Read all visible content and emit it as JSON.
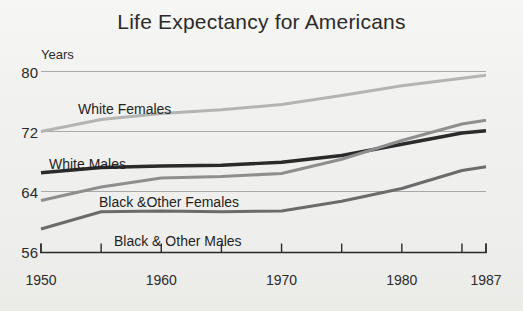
{
  "chart_data": {
    "type": "line",
    "title": "Life Expectancy for Americans",
    "xlabel": "",
    "ylabel": "Years",
    "ylim": [
      56,
      82
    ],
    "xlim": [
      1950,
      1987
    ],
    "grid": true,
    "gridlines_y": [
      64,
      72,
      80
    ],
    "legend_position": "inline-labels",
    "x": [
      1950,
      1955,
      1960,
      1965,
      1970,
      1975,
      1980,
      1985,
      1987
    ],
    "y_ticks": [
      56,
      64,
      72,
      80
    ],
    "y_tick_labels": [
      "56",
      "64",
      "72",
      "80"
    ],
    "x_ticks": [
      1950,
      1955,
      1960,
      1965,
      1970,
      1975,
      1980,
      1985,
      1987
    ],
    "x_tick_labels_visible": [
      "1950",
      "1960",
      "1970",
      "1980",
      "1987"
    ],
    "x_tick_labels_visible_values": [
      1950,
      1960,
      1970,
      1980,
      1987
    ],
    "series": [
      {
        "name": "White Females",
        "color": "#b4b4b4",
        "width": 3.0,
        "label_x": 78,
        "label_y": 101,
        "values": [
          72.0,
          73.6,
          74.4,
          74.9,
          75.6,
          76.8,
          78.1,
          79.1,
          79.5
        ]
      },
      {
        "name": "White Males",
        "color": "#2a2a2a",
        "width": 3.4,
        "label_x": 49,
        "label_y": 156,
        "values": [
          66.5,
          67.2,
          67.4,
          67.5,
          67.9,
          68.8,
          70.3,
          71.8,
          72.1
        ]
      },
      {
        "name": "Black &Other Females",
        "color": "#8e8e8e",
        "width": 3.0,
        "label_x": 99,
        "label_y": 194,
        "values": [
          62.8,
          64.6,
          65.8,
          66.0,
          66.4,
          68.3,
          70.8,
          73.0,
          73.5
        ]
      },
      {
        "name": "Black & Other Males",
        "color": "#6b6b6b",
        "width": 3.0,
        "label_x": 114,
        "label_y": 233,
        "values": [
          59.0,
          61.3,
          61.4,
          61.3,
          61.4,
          62.7,
          64.4,
          66.8,
          67.3
        ]
      }
    ]
  },
  "axis": {
    "unit_label": "Years"
  },
  "colors": {
    "background": "#f2f2f0",
    "text": "#2b2b2b",
    "grid": "#a9a9a9",
    "axis": "#2b2b2b"
  }
}
